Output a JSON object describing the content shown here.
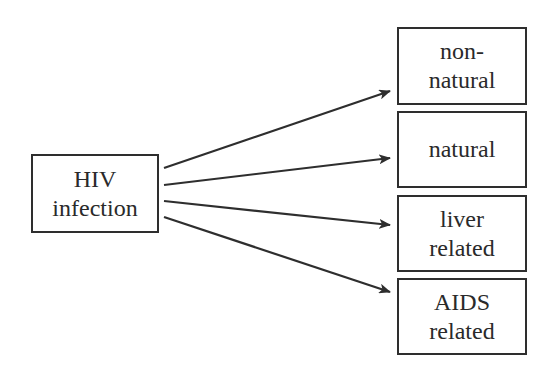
{
  "diagram": {
    "source": {
      "id": "hiv",
      "lines": [
        "HIV",
        "infection"
      ]
    },
    "targets": [
      {
        "id": "non-natural",
        "lines": [
          "non-",
          "natural"
        ]
      },
      {
        "id": "natural",
        "lines": [
          "natural"
        ]
      },
      {
        "id": "liver-related",
        "lines": [
          "liver",
          "related"
        ]
      },
      {
        "id": "aids-related",
        "lines": [
          "AIDS",
          "related"
        ]
      }
    ],
    "edges": [
      {
        "from": "hiv",
        "to": "non-natural"
      },
      {
        "from": "hiv",
        "to": "natural"
      },
      {
        "from": "hiv",
        "to": "liver-related"
      },
      {
        "from": "hiv",
        "to": "aids-related"
      }
    ],
    "colors": {
      "stroke": "#2e2e2e",
      "text": "#2a2a2a",
      "background": "#ffffff"
    }
  }
}
